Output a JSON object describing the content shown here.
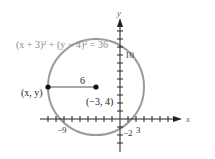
{
  "figure": {
    "equation": "(x + 3)² + (y − 4)² = 36",
    "x_axis_label": "x",
    "y_axis_label": "y",
    "center_label": "(−3, 4)",
    "point_label": "(x, y)",
    "radius_label": "6",
    "tick_labels": {
      "x_neg9": "−9",
      "x_3": "3",
      "y_10": "10",
      "y_neg2": "−2"
    },
    "colors": {
      "circle": "#9a9a9a",
      "equation_text": "#8a8a8a",
      "axes": "#222222",
      "radius_line": "#8a8a8a"
    },
    "circle": {
      "center": [
        -3,
        4
      ],
      "radius": 6
    },
    "point": [
      -9,
      4
    ],
    "x_range": [
      -10,
      7
    ],
    "y_range": [
      -4,
      12
    ]
  }
}
